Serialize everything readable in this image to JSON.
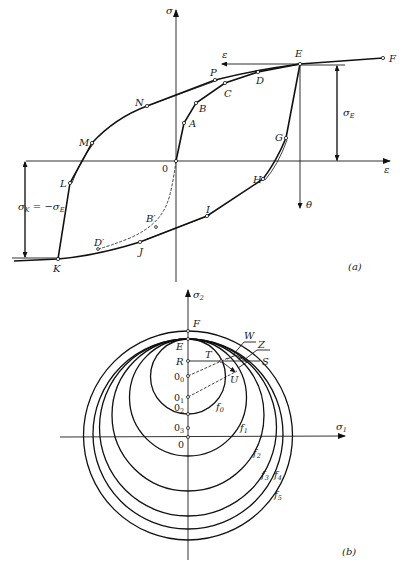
{
  "panel_a": {
    "caption": "(a)",
    "axis_sigma_label": "σ",
    "axis_epsilon_label": "ε",
    "arrow_epsilon_label": "ε",
    "arrow_theta_label": "θ",
    "sigma_E_label": "σ",
    "sigma_E_sub": "E",
    "sigma_K_label_main": "σ",
    "sigma_K_sub": "K",
    "sigma_K_eq": " = −σ",
    "sigma_K_eq_sub": "E",
    "points": {
      "O": "0",
      "A": "A",
      "B": "B",
      "C": "C",
      "D": "D",
      "E": "E",
      "F": "F",
      "G": "G",
      "H": "H",
      "I": "I",
      "J": "J",
      "K": "K",
      "L": "L",
      "M": "M",
      "N": "N",
      "P": "P",
      "B_prime": "B′",
      "D_prime": "D′"
    }
  },
  "panel_b": {
    "caption": "(b)",
    "axis_sigma2_label": "σ",
    "axis_sigma2_sub": "2",
    "axis_sigma1_label": "σ",
    "axis_sigma1_sub": "1",
    "points": {
      "F": "F",
      "E": "E",
      "R": "R",
      "O0": "0",
      "O0_sub": "0",
      "O1": "0",
      "O1_sub": "1",
      "O2": "0",
      "O2_sub": "2",
      "O3": "0",
      "O3_sub": "3",
      "O": "0",
      "T": "T",
      "S": "S",
      "U": "U",
      "W": "W",
      "Z": "Z"
    },
    "surfaces": [
      {
        "name": "f",
        "sub": "0"
      },
      {
        "name": "f",
        "sub": "1"
      },
      {
        "name": "f",
        "sub": "2"
      },
      {
        "name": "f",
        "sub": "3"
      },
      {
        "name": "f",
        "sub": "4"
      },
      {
        "name": "f",
        "sub": "5"
      }
    ]
  }
}
